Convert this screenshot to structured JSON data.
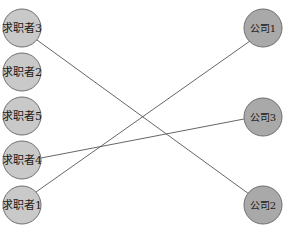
{
  "diagram": {
    "type": "bipartite-matching",
    "left_nodes": [
      {
        "id": "s3",
        "label": "求职者3",
        "x": 22,
        "y": 28
      },
      {
        "id": "s2",
        "label": "求职者2",
        "x": 22,
        "y": 72
      },
      {
        "id": "s5",
        "label": "求职者5",
        "x": 22,
        "y": 116
      },
      {
        "id": "s4",
        "label": "求职者4",
        "x": 22,
        "y": 160
      },
      {
        "id": "s1",
        "label": "求职者1",
        "x": 22,
        "y": 205
      }
    ],
    "right_nodes": [
      {
        "id": "c1",
        "label": "公司1",
        "x": 263,
        "y": 28
      },
      {
        "id": "c3",
        "label": "公司3",
        "x": 263,
        "y": 117
      },
      {
        "id": "c2",
        "label": "公司2",
        "x": 263,
        "y": 205
      }
    ],
    "edges": [
      {
        "from": "求职者3",
        "to": "公司2"
      },
      {
        "from": "求职者4",
        "to": "公司3"
      },
      {
        "from": "求职者1",
        "to": "公司1"
      }
    ],
    "colors": {
      "left_fill": "#c9c9c9",
      "right_fill": "#a9a9a9",
      "stroke": "#6e6e6e",
      "edge": "#555555"
    }
  }
}
